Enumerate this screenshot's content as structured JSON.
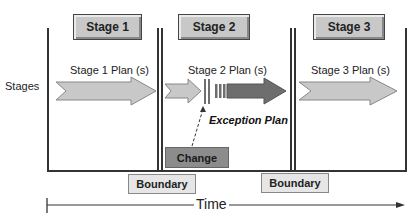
{
  "diagram": {
    "row_label": "Stages",
    "stages": [
      {
        "title": "Stage 1",
        "plan_label": "Stage 1 Plan (s)"
      },
      {
        "title": "Stage 2",
        "plan_label": "Stage 2 Plan (s)"
      },
      {
        "title": "Stage 3",
        "plan_label": "Stage 3 Plan (s)"
      }
    ],
    "exception_label": "Exception Plan",
    "change_label": "Change",
    "boundaries": [
      {
        "label": "Boundary"
      },
      {
        "label": "Boundary"
      }
    ],
    "time_label": "Time",
    "colors": {
      "light_arrow": "#c8c8c8",
      "dark_arrow": "#6e6e6e",
      "stage_box": "#c8c8c8",
      "change_box": "#8c8c8c",
      "boundary_box": "#e6e6e6",
      "lines": "#333333"
    }
  }
}
